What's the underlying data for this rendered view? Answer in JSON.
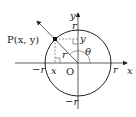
{
  "diagram": {
    "type": "unit-circle-trig-definition",
    "point_label": "P(x, y)",
    "origin_label": "O",
    "axis_x_label": "x",
    "axis_y_label": "y",
    "angle_label": "θ",
    "radius_label": "r",
    "x_label": "x",
    "y_label": "y",
    "r_pos_x": "r",
    "r_neg_x": "−r",
    "r_pos_y": "r",
    "r_neg_y": "−r",
    "colors": {
      "stroke": "#222222",
      "dashed": "#555555",
      "background": "#ffffff"
    }
  }
}
